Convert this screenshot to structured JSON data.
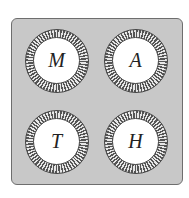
{
  "figure": {
    "type": "tile-board",
    "background_color": "#c8c8c8",
    "tiles": [
      {
        "label": "M",
        "position": "top-left"
      },
      {
        "label": "A",
        "position": "top-right"
      },
      {
        "label": "T",
        "position": "bottom-left"
      },
      {
        "label": "H",
        "position": "bottom-right"
      }
    ]
  }
}
